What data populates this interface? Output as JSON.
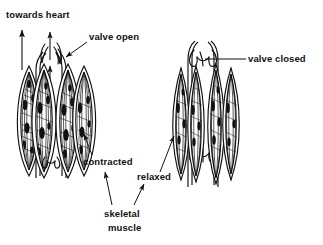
{
  "diagram": {
    "background_color": "#ffffff",
    "ink_color": "#111111",
    "labels": {
      "towards_heart": "towards heart",
      "valve_open": "valve open",
      "valve_closed": "valve closed",
      "contracted": "contracted",
      "relaxed": "relaxed",
      "skeletal_muscle_line1": "skeletal",
      "skeletal_muscle_line2": "muscle"
    },
    "panels": [
      {
        "id": "left-panel",
        "state": "contracted",
        "valve_state": "open",
        "blood_flow": "upward, towards heart",
        "arrow_count": 3
      },
      {
        "id": "right-panel",
        "state": "relaxed",
        "valve_state": "closed",
        "blood_flow": "none",
        "arrow_count": 0
      }
    ]
  }
}
